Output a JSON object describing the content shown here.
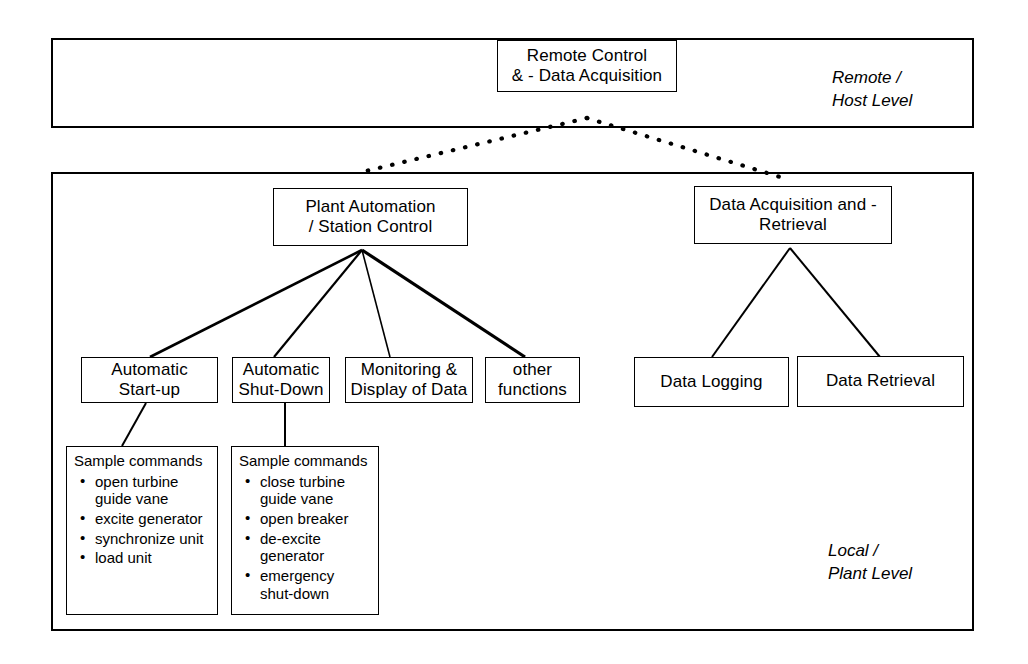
{
  "diagram": {
    "levels": [
      {
        "id": "remote",
        "label": "Remote /\nHost Level"
      },
      {
        "id": "local",
        "label": "Local /\nPlant Level"
      }
    ],
    "nodes": {
      "remote_control": "Remote Control\n& - Data Acquisition",
      "plant_automation": "Plant Automation\n/ Station Control",
      "data_acquisition": "Data Acquisition and -\nRetrieval",
      "auto_startup": "Automatic\nStart-up",
      "auto_shutdown": "Automatic\nShut-Down",
      "monitoring": "Monitoring &\nDisplay of Data",
      "other_functions": "other\nfunctions",
      "data_logging": "Data Logging",
      "data_retrieval": "Data Retrieval"
    },
    "command_boxes": [
      {
        "id": "startup-commands",
        "title": "Sample commands",
        "items": [
          "open turbine\nguide vane",
          "excite generator",
          "synchronize unit",
          "load unit"
        ]
      },
      {
        "id": "shutdown-commands",
        "title": "Sample commands",
        "items": [
          "close turbine\nguide vane",
          "open breaker",
          "de-excite\ngenerator",
          "emergency\nshut-down"
        ]
      }
    ],
    "colors": {
      "line": "#000000",
      "background": "#ffffff",
      "text": "#000000"
    }
  }
}
